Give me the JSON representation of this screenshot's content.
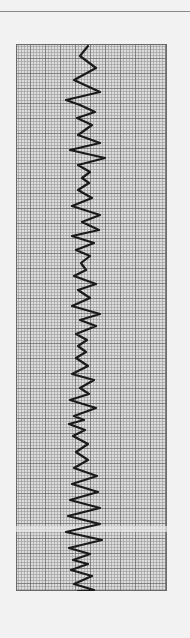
{
  "figure": {
    "colors": {
      "background": "#f2f2f2",
      "paper": "#d9d9d9",
      "grid_fine": "#8c8c8c",
      "grid_major": "#555555",
      "trace": "#1a1a1a",
      "rule": "#8a8a8a"
    },
    "grid": {
      "x": 16,
      "y": 44,
      "width": 151,
      "height": 547,
      "fine_spacing": 3,
      "major_every": 5
    },
    "trace_points": "72,2 64,12 80,24 58,36 84,48 50,56 64,61 79,68 61,74 76,81 62,91 84,99 54,106 89,114 62,121 74,128 66,134 73,139 62,146 76,154 56,162 84,171 66,178 83,186 56,192 78,199 60,206 74,212 65,219 70,226 58,232 80,240 62,246 74,254 56,262 84,270 64,276 80,282 60,290 71,296 62,302 70,308 60,314 72,322 56,330 78,336 64,344 73,350 54,356 80,364 58,372 68,376 53,380 69,386 57,392 72,400 60,408 72,416 58,424 81,432 56,440 82,448 54,456 84,464 52,472 84,480 50,488 86,496 53,504 74,510 57,516 72,520 55,526 76,532 58,540 78,546 62,547"
  }
}
